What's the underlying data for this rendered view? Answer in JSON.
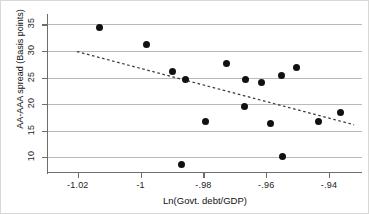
{
  "chart_data": {
    "type": "scatter",
    "title": "",
    "xlabel": "Ln(Govt. debt/GDP)",
    "ylabel": "AA-AAA spread (Basis points)",
    "xlim": [
      -1.0295,
      -0.9295
    ],
    "ylim": [
      7.2,
      36.6
    ],
    "xticks": [
      -1.02,
      -1.0,
      -0.98,
      -0.96,
      -0.94
    ],
    "xtick_labels": [
      "-1.02",
      "-1",
      "-.98",
      "-.96",
      "-.94"
    ],
    "yticks": [
      10,
      15,
      20,
      25,
      30,
      35
    ],
    "ytick_labels": [
      "10",
      "15",
      "20",
      "25",
      "30",
      "35"
    ],
    "grid": "horizontal",
    "legend": "none",
    "marker": "filled-circle",
    "marker_color": "#111111",
    "grid_color": "#b9b9b9",
    "axis_color": "#6d6d6d",
    "points": [
      {
        "x": -1.0132,
        "y": 34.5
      },
      {
        "x": -0.9982,
        "y": 31.3
      },
      {
        "x": -0.9898,
        "y": 26.1
      },
      {
        "x": -0.9856,
        "y": 24.7
      },
      {
        "x": -0.9869,
        "y": 8.7
      },
      {
        "x": -0.9795,
        "y": 16.8
      },
      {
        "x": -0.9727,
        "y": 27.6
      },
      {
        "x": -0.9665,
        "y": 24.7
      },
      {
        "x": -0.9668,
        "y": 19.5
      },
      {
        "x": -0.9615,
        "y": 24.1
      },
      {
        "x": -0.9585,
        "y": 16.3
      },
      {
        "x": -0.9551,
        "y": 25.4
      },
      {
        "x": -0.9549,
        "y": 10.1
      },
      {
        "x": -0.9503,
        "y": 26.9
      },
      {
        "x": -0.9433,
        "y": 16.8
      },
      {
        "x": -0.9365,
        "y": 18.4
      }
    ],
    "trendline": {
      "type": "dashed-linear-fit",
      "color": "#3a3a3a",
      "x_start": -1.0203,
      "y_start": 29.9,
      "x_end": -0.932,
      "y_end": 16.1
    }
  }
}
